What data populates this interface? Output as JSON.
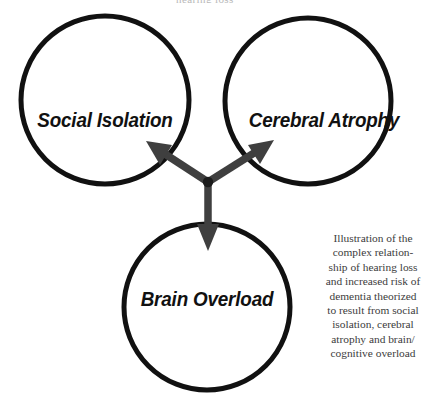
{
  "figure": {
    "background_color": "#ffffff",
    "width": 435,
    "height": 405,
    "top_clipped_remnant": "hearing loss"
  },
  "colors": {
    "circle_stroke": "#111111",
    "arrow_fill": "#3f3f3f",
    "label_text": "#111111",
    "caption_text": "#3c3c3c",
    "background": "#ffffff"
  },
  "nodes": [
    {
      "id": "social-isolation",
      "label": "Social Isolation",
      "cx": 105,
      "cy": 100,
      "r": 84,
      "stroke_width": 5
    },
    {
      "id": "cerebral-atrophy",
      "label": "Cerebral Atrophy",
      "cx": 308,
      "cy": 101,
      "r": 83,
      "stroke_width": 5
    },
    {
      "id": "brain-overload",
      "label": "Brain Overload",
      "cx": 207,
      "cy": 307,
      "r": 83,
      "stroke_width": 5
    }
  ],
  "arrows": {
    "hub": {
      "x": 208,
      "y": 182,
      "dot_radius": 5
    },
    "items": [
      {
        "id": "arrow-to-social-isolation",
        "direction": "up-left",
        "target": "social-isolation",
        "tip": {
          "x": 148,
          "y": 143
        }
      },
      {
        "id": "arrow-to-cerebral-atrophy",
        "direction": "up-right",
        "target": "cerebral-atrophy",
        "tip": {
          "x": 272,
          "y": 141
        }
      },
      {
        "id": "arrow-to-brain-overload",
        "direction": "down",
        "target": "brain-overload",
        "tip": {
          "x": 208,
          "y": 250
        }
      }
    ]
  },
  "caption": {
    "text": "Illustration of the complex relationship of hearing loss and increased risk of dementia theorized to result from social isolation, cerebral atrophy and brain/ cognitive overload",
    "lines": [
      "Illustration of the",
      "complex relation-",
      "ship of hearing loss",
      "and increased risk of",
      "dementia theorized",
      "to result from social",
      "isolation, cerebral",
      "atrophy and brain/",
      "cognitive overload"
    ]
  }
}
